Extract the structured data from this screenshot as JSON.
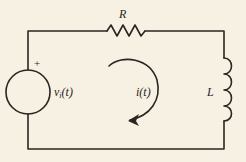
{
  "diagram": {
    "type": "series RL circuit",
    "colors": {
      "background": "#f6f1e2",
      "stroke": "#2a2622"
    },
    "components": {
      "resistor": {
        "label": "R"
      },
      "inductor": {
        "label": "L"
      },
      "source": {
        "label_main": "v",
        "label_sub": "i",
        "label_arg": "(t)",
        "polarity": "+"
      },
      "current": {
        "label": "i(t)",
        "direction": "clockwise"
      }
    }
  }
}
